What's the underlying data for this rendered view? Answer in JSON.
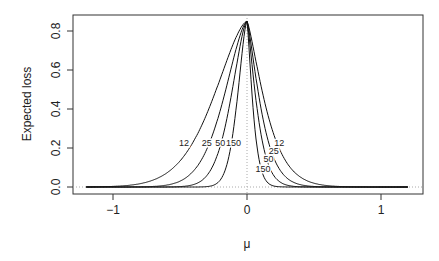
{
  "chart_data": {
    "type": "line",
    "title": "",
    "xlabel": "μ",
    "ylabel": "Expected loss",
    "xlim": [
      -1.3,
      1.3
    ],
    "ylim": [
      -0.03,
      0.88
    ],
    "x_ticks": [
      "−1",
      "0",
      "1"
    ],
    "x_tick_values": [
      -1,
      0,
      1
    ],
    "y_ticks": [
      "0.0",
      "0.2",
      "0.4",
      "0.6",
      "0.8"
    ],
    "y_tick_values": [
      0.0,
      0.2,
      0.4,
      0.6,
      0.8
    ],
    "grid": false,
    "reference_lines": [
      {
        "orientation": "vertical",
        "value": 0,
        "style": "dotted"
      },
      {
        "orientation": "horizontal",
        "value": 0,
        "style": "dotted"
      }
    ],
    "peak": {
      "x": 0,
      "y": 0.85
    },
    "series": [
      {
        "name": "12",
        "label_left_at": [
          -0.47,
          0.23
        ],
        "label_right_at": [
          0.24,
          0.23
        ],
        "left_scale": 0.42,
        "right_scale": 0.22
      },
      {
        "name": "25",
        "label_left_at": [
          -0.3,
          0.23
        ],
        "label_right_at": [
          0.2,
          0.19
        ],
        "left_scale": 0.29,
        "right_scale": 0.16
      },
      {
        "name": "50",
        "label_left_at": [
          -0.2,
          0.23
        ],
        "label_right_at": [
          0.16,
          0.15
        ],
        "left_scale": 0.2,
        "right_scale": 0.115
      },
      {
        "name": "150",
        "label_left_at": [
          -0.1,
          0.23
        ],
        "label_right_at": [
          0.12,
          0.1
        ],
        "left_scale": 0.12,
        "right_scale": 0.07
      }
    ]
  }
}
